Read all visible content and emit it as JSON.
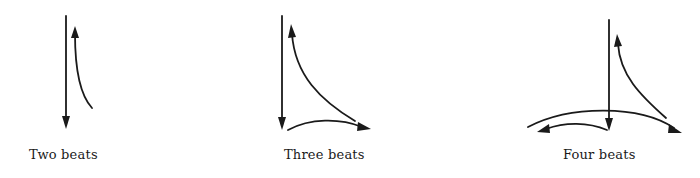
{
  "stroke_color": "#1a1a1a",
  "background": "#ffffff",
  "patterns": [
    {
      "label": "Two beats",
      "beats": 2,
      "strokes": [
        {
          "description": "downbeat straight down",
          "direction": "down"
        },
        {
          "description": "curved upbeat rising",
          "direction": "up"
        }
      ]
    },
    {
      "label": "Three beats",
      "beats": 3,
      "strokes": [
        {
          "description": "downbeat straight down",
          "direction": "down"
        },
        {
          "description": "arc to the right",
          "direction": "right"
        },
        {
          "description": "curved upbeat rising back to top",
          "direction": "up"
        }
      ]
    },
    {
      "label": "Four beats",
      "beats": 4,
      "strokes": [
        {
          "description": "downbeat straight down",
          "direction": "down"
        },
        {
          "description": "arc to the left",
          "direction": "left"
        },
        {
          "description": "wide arc across to the right",
          "direction": "right"
        },
        {
          "description": "curved upbeat rising back to top",
          "direction": "up"
        }
      ]
    }
  ]
}
